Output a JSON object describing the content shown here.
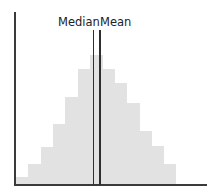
{
  "chart_data": {
    "type": "bar",
    "subtype": "histogram",
    "title": "",
    "xlabel": "",
    "ylabel": "",
    "grid": false,
    "legend": false,
    "categories": [
      "1",
      "2",
      "3",
      "4",
      "5",
      "6",
      "7",
      "8",
      "9",
      "10",
      "11",
      "12",
      "13"
    ],
    "values": [
      7,
      20,
      37,
      60,
      87,
      115,
      129,
      115,
      101,
      81,
      53,
      38,
      20
    ],
    "ylim": [
      0,
      173
    ],
    "bar_color": "#e2e2e2",
    "axis_color": "#3a3a3a",
    "annotations": [
      {
        "label": "Median",
        "x_position": 6.55,
        "type": "vertical-line"
      },
      {
        "label": "Mean",
        "x_position": 7.05,
        "type": "vertical-line"
      }
    ]
  },
  "labels": {
    "median": "Median",
    "mean": "Mean"
  }
}
